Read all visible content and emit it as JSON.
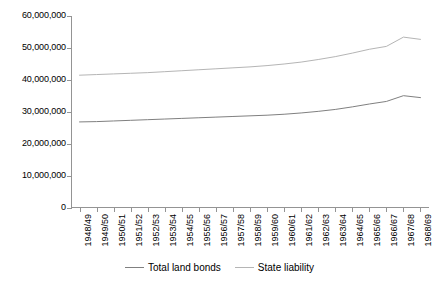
{
  "chart_data": {
    "type": "line",
    "title": "",
    "xlabel": "",
    "ylabel": "",
    "grid": false,
    "legend_position": "bottom",
    "ylim": [
      0,
      60000000
    ],
    "yticks": [
      0,
      10000000,
      20000000,
      30000000,
      40000000,
      50000000,
      60000000
    ],
    "ytick_labels": [
      "0",
      "10,000,000",
      "20,000,000",
      "30,000,000",
      "40,000,000",
      "50,000,000",
      "60,000,000"
    ],
    "categories": [
      "1948/49",
      "1949/50",
      "1950/51",
      "1951/52",
      "1952/53",
      "1953/54",
      "1954/55",
      "1955/56",
      "1956/57",
      "1957/58",
      "1958/59",
      "1959/60",
      "1960/61",
      "1961/62",
      "1962/63",
      "1963/64",
      "1964/65",
      "1965/66",
      "1966/67",
      "1967/68",
      "1968/69"
    ],
    "series": [
      {
        "name": "Total land bonds",
        "color": "#808080",
        "values": [
          26900000,
          27000000,
          27200000,
          27400000,
          27600000,
          27800000,
          28000000,
          28200000,
          28400000,
          28600000,
          28800000,
          29000000,
          29300000,
          29700000,
          30200000,
          30800000,
          31600000,
          32500000,
          33300000,
          35100000,
          34500000
        ]
      },
      {
        "name": "State liability",
        "color": "#b5b5b5",
        "values": [
          41500000,
          41700000,
          41900000,
          42100000,
          42300000,
          42600000,
          42900000,
          43200000,
          43500000,
          43800000,
          44100000,
          44500000,
          45000000,
          45600000,
          46400000,
          47300000,
          48400000,
          49600000,
          50500000,
          53400000,
          52700000
        ]
      }
    ]
  },
  "legend": {
    "entries": [
      {
        "label": "Total land bonds",
        "color": "#808080"
      },
      {
        "label": "State liability",
        "color": "#b5b5b5"
      }
    ]
  },
  "axis": {
    "line_color": "#949494"
  }
}
